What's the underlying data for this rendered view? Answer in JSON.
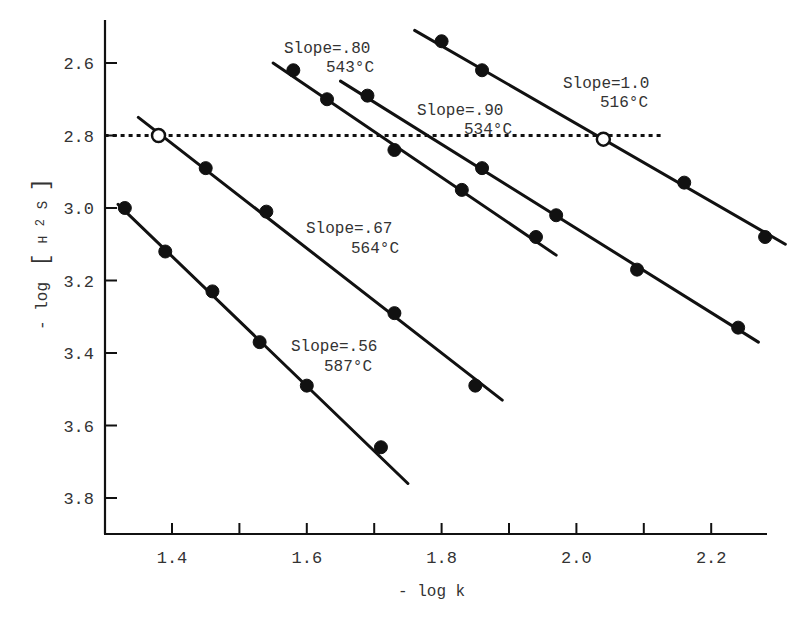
{
  "chart_data": {
    "type": "scatter",
    "title": "",
    "xlabel": "- log k",
    "ylabel": "- log [H2S]",
    "xlim": [
      1.3,
      2.28
    ],
    "ylim": [
      3.9,
      2.48
    ],
    "y_inverted": true,
    "grid": false,
    "legend": "none (inline annotations)",
    "x_ticks": [
      1.4,
      1.6,
      1.8,
      2.0,
      2.2
    ],
    "x_tick_labels": [
      "1.4",
      "1.6",
      "1.8",
      "2.0",
      "2.2"
    ],
    "x_minor_ticks": [
      1.5,
      1.7,
      1.9,
      2.1
    ],
    "y_ticks": [
      2.6,
      2.8,
      3.0,
      3.2,
      3.4,
      3.6,
      3.8
    ],
    "y_tick_labels": [
      "2.6",
      "2.8",
      "3.0",
      "3.2",
      "3.4",
      "3.6",
      "3.8"
    ],
    "reference_line": {
      "style": "dotted",
      "y": 2.8,
      "x_from": 1.3,
      "x_to": 2.13
    },
    "series": [
      {
        "name": "Slope=.56 587°C",
        "slope_label": "Slope=.56",
        "temp_label": "587°C",
        "x": [
          1.33,
          1.39,
          1.46,
          1.53,
          1.6,
          1.71
        ],
        "y": [
          3.0,
          3.12,
          3.23,
          3.37,
          3.49,
          3.66
        ],
        "fit_line": {
          "x": [
            1.32,
            1.75
          ],
          "y": [
            2.99,
            3.76
          ]
        }
      },
      {
        "name": "Slope=.67 564°C",
        "slope_label": "Slope=.67",
        "temp_label": "564°C",
        "x": [
          1.38,
          1.45,
          1.54,
          1.73,
          1.85
        ],
        "y": [
          2.8,
          2.89,
          3.01,
          3.29,
          3.49
        ],
        "open_marker_index": 0,
        "fit_line": {
          "x": [
            1.35,
            1.89
          ],
          "y": [
            2.75,
            3.53
          ]
        }
      },
      {
        "name": "Slope=.80 543°C",
        "slope_label": "Slope=.80",
        "temp_label": "543°C",
        "x": [
          1.58,
          1.63,
          1.73,
          1.83,
          1.94
        ],
        "y": [
          2.62,
          2.7,
          2.84,
          2.95,
          3.08
        ],
        "fit_line": {
          "x": [
            1.55,
            1.97
          ],
          "y": [
            2.6,
            3.13
          ]
        }
      },
      {
        "name": "Slope=.90 534°C",
        "slope_label": "Slope=.90",
        "temp_label": "534°C",
        "x": [
          1.69,
          1.86,
          1.97,
          2.09,
          2.24
        ],
        "y": [
          2.69,
          2.89,
          3.02,
          3.17,
          3.33
        ],
        "fit_line": {
          "x": [
            1.65,
            2.27
          ],
          "y": [
            2.65,
            3.37
          ]
        }
      },
      {
        "name": "Slope=1.0 516°C",
        "slope_label": "Slope=1.0",
        "temp_label": "516°C",
        "x": [
          1.8,
          1.86,
          2.04,
          2.16,
          2.28
        ],
        "y": [
          2.54,
          2.62,
          2.81,
          2.93,
          3.08
        ],
        "open_marker_index": 2,
        "fit_line": {
          "x": [
            1.76,
            2.31
          ],
          "y": [
            2.51,
            3.1
          ]
        }
      }
    ]
  },
  "axes": {
    "x_title": "- log k",
    "y_title_prefix": "- log",
    "y_title_species": "H",
    "y_title_sub": "2",
    "y_title_suffix": "S"
  },
  "annotations": [
    {
      "slope": "Slope=.80",
      "temp": "543°C"
    },
    {
      "slope": "Slope=.90",
      "temp": "534°C"
    },
    {
      "slope": "Slope=1.0",
      "temp": "516°C"
    },
    {
      "slope": "Slope=.67",
      "temp": "564°C"
    },
    {
      "slope": "Slope=.56",
      "temp": "587°C"
    }
  ],
  "ticks": {
    "x": [
      "1.4",
      "1.6",
      "1.8",
      "2.0",
      "2.2"
    ],
    "y": [
      "2.6",
      "2.8",
      "3.0",
      "3.2",
      "3.4",
      "3.6",
      "3.8"
    ]
  }
}
